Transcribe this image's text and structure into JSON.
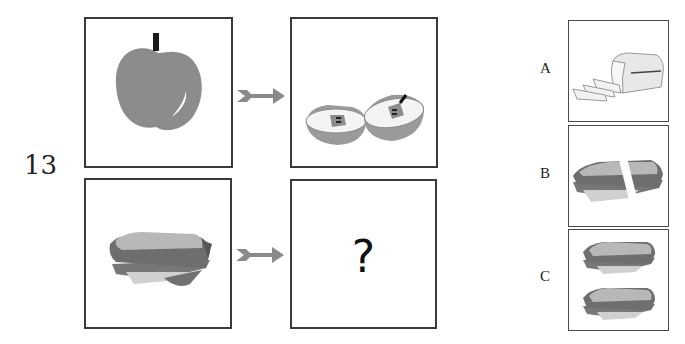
{
  "question": {
    "number": "13",
    "unknown_symbol": "?"
  },
  "grid": {
    "row1": {
      "source": {
        "icon": "apple-icon",
        "description": "whole apple"
      },
      "target": {
        "icon": "apple-halves-icon",
        "description": "apple cut in two halves"
      }
    },
    "row2": {
      "source": {
        "icon": "sandwich-icon",
        "description": "whole sandwich"
      },
      "target": {
        "icon": "question-mark",
        "description": "unknown"
      }
    },
    "arrow_icon": "arrow-right-icon"
  },
  "options": [
    {
      "label": "A",
      "icon": "sliced-bread-loaf-icon",
      "description": "bread loaf with slices"
    },
    {
      "label": "B",
      "icon": "cut-sandwich-icon",
      "description": "sandwich cut in two"
    },
    {
      "label": "C",
      "icon": "two-sandwiches-icon",
      "description": "two whole sandwiches"
    }
  ],
  "colors": {
    "border": "#3a3a3a",
    "arrow": "#8a8a8a",
    "fruit": "#8c8c8c",
    "bread_top": "#b5b5b5",
    "bread_crust": "#6e6e6e",
    "cheese": "#cfcfcf"
  }
}
